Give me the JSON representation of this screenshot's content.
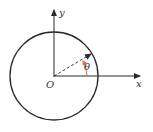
{
  "diagram": {
    "type": "unit-circle-polar-angle",
    "labels": {
      "y_axis": "y",
      "x_axis": "x",
      "origin": "O",
      "angle": "θ"
    },
    "colors": {
      "stroke": "#2a2a2a",
      "angle_arc": "#e8645a",
      "background": "#ffffff"
    }
  }
}
